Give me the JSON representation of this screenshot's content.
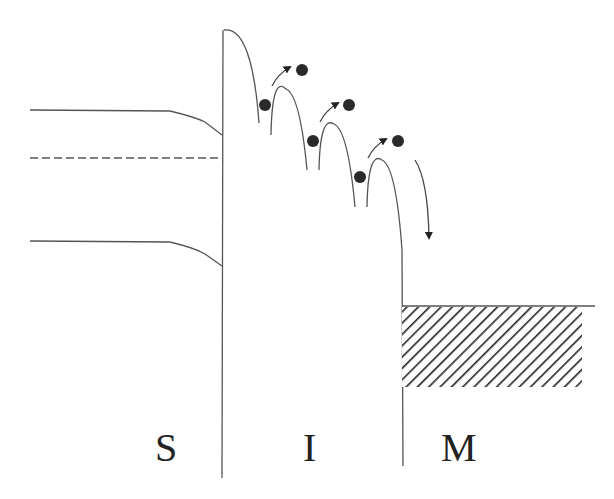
{
  "diagram": {
    "type": "energy-band-diagram",
    "regions": [
      {
        "id": "semiconductor",
        "label": "S"
      },
      {
        "id": "insulator",
        "label": "I"
      },
      {
        "id": "metal",
        "label": "M"
      }
    ],
    "colors": {
      "line": "#555555",
      "electron": "#2a2a2a",
      "hatch": "#222222",
      "background": "#ffffff"
    },
    "elements": {
      "semiconductor_bands": [
        "conduction-band",
        "fermi-level-dashed",
        "valence-band"
      ],
      "insulator": "hopping barriers with electrons",
      "electron_count": 6,
      "hop_arrows": 3,
      "final_drop_arrow": 1,
      "metal": "filled states (hatched)"
    }
  }
}
